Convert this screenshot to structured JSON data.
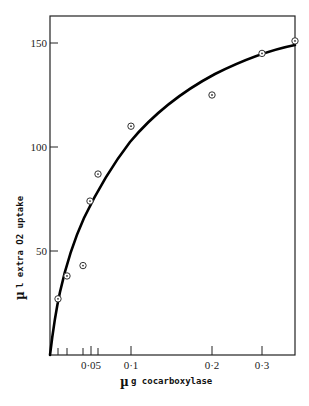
{
  "chart_data": {
    "type": "scatter",
    "title": "",
    "xlabel": "µ g cocarboxylase",
    "ylabel": "µ l extra O2 uptake",
    "xlabel_prefix": "µ",
    "xlabel_text": "g cocarboxylase",
    "ylabel_prefix": "µ",
    "ylabel_text": "l extra O2 uptake",
    "x_scale": "nonlinear (compressed at high doses)",
    "xlim": [
      0,
      0.375
    ],
    "ylim": [
      0,
      165
    ],
    "x_ticks": [
      {
        "label": "0·05",
        "value": 0.05
      },
      {
        "label": "0·1",
        "value": 0.1
      },
      {
        "label": "0·2",
        "value": 0.2
      },
      {
        "label": "0·3",
        "value": 0.3
      }
    ],
    "x_minor_ticks": [
      0.01,
      0.02,
      0.04,
      0.06
    ],
    "y_ticks": [
      {
        "label": "50",
        "value": 50
      },
      {
        "label": "100",
        "value": 100
      },
      {
        "label": "150",
        "value": 150
      }
    ],
    "grid": false,
    "legend": null,
    "series": [
      {
        "name": "observed",
        "marker": "circle-dot",
        "points": [
          {
            "x": 0.01,
            "y": 27
          },
          {
            "x": 0.02,
            "y": 38
          },
          {
            "x": 0.04,
            "y": 43
          },
          {
            "x": 0.045,
            "y": 74
          },
          {
            "x": 0.06,
            "y": 87
          },
          {
            "x": 0.1,
            "y": 110
          },
          {
            "x": 0.2,
            "y": 125
          },
          {
            "x": 0.3,
            "y": 145
          },
          {
            "x": 0.375,
            "y": 151
          }
        ]
      },
      {
        "name": "fitted curve",
        "style": "thick solid line",
        "points": [
          {
            "x": 0,
            "y": 0
          },
          {
            "x": 0.01,
            "y": 30
          },
          {
            "x": 0.02,
            "y": 45
          },
          {
            "x": 0.04,
            "y": 68
          },
          {
            "x": 0.06,
            "y": 82
          },
          {
            "x": 0.1,
            "y": 105
          },
          {
            "x": 0.2,
            "y": 134
          },
          {
            "x": 0.3,
            "y": 146
          },
          {
            "x": 0.375,
            "y": 149
          }
        ]
      }
    ],
    "pixel_map": {
      "x": [
        [
          0,
          50
        ],
        [
          0.01,
          58
        ],
        [
          0.02,
          67
        ],
        [
          0.04,
          83
        ],
        [
          0.045,
          90
        ],
        [
          0.05,
          91
        ],
        [
          0.06,
          98
        ],
        [
          0.1,
          131
        ],
        [
          0.2,
          212
        ],
        [
          0.3,
          262
        ],
        [
          0.375,
          295
        ]
      ],
      "y0": 355,
      "px_per_unit": 2.08
    }
  }
}
